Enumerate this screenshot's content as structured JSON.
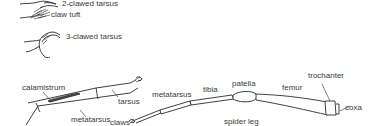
{
  "diagram": {
    "caption": "spider leg",
    "insets": {
      "two_clawed": "2-clawed tarsus",
      "claw_tuft": "claw tuft",
      "three_clawed": "3-clawed tarsus"
    },
    "detail_leg": {
      "calamistrum": "calamistrum",
      "metatarsus": "metatarsus",
      "tarsus": "tarsus",
      "claws": "claws"
    },
    "main_leg": {
      "metatarsus": "metatarsus",
      "tibia": "tibia",
      "patella": "patella",
      "femur": "femur",
      "trochanter": "trochanter",
      "coxa": "coxa"
    },
    "colors": {
      "ink": "#2a2a2a",
      "text": "#3a3a3a",
      "background": "#ffffff"
    }
  }
}
